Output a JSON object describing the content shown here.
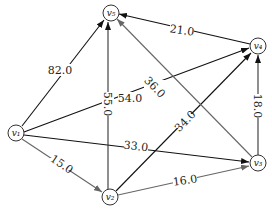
{
  "graph": {
    "type": "directed-weighted",
    "nodes": [
      {
        "id": "v1",
        "label": "v1",
        "x": 16,
        "y": 133
      },
      {
        "id": "v2",
        "label": "v2",
        "x": 110,
        "y": 197
      },
      {
        "id": "v3",
        "label": "v3",
        "x": 258,
        "y": 163
      },
      {
        "id": "v4",
        "label": "v4",
        "x": 258,
        "y": 46
      },
      {
        "id": "v5",
        "label": "v5",
        "x": 111,
        "y": 13
      }
    ],
    "edges": [
      {
        "from": "v1",
        "to": "v5",
        "weight": "82.0",
        "color": "#111111"
      },
      {
        "from": "v1",
        "to": "v4",
        "weight": "54.0",
        "color": "#111111"
      },
      {
        "from": "v1",
        "to": "v3",
        "weight": "33.0",
        "color": "#111111"
      },
      {
        "from": "v1",
        "to": "v2",
        "weight": "15.0",
        "color": "#666666"
      },
      {
        "from": "v2",
        "to": "v5",
        "weight": "55.0",
        "color": "#333333"
      },
      {
        "from": "v2",
        "to": "v4",
        "weight": "34.0",
        "color": "#111111"
      },
      {
        "from": "v2",
        "to": "v3",
        "weight": "16.0",
        "color": "#666666"
      },
      {
        "from": "v3",
        "to": "v4",
        "weight": "18.0",
        "color": "#333333"
      },
      {
        "from": "v3",
        "to": "v5",
        "weight": "36.0",
        "color": "#666666"
      },
      {
        "from": "v4",
        "to": "v5",
        "weight": "21.0",
        "color": "#111111"
      }
    ]
  },
  "labels": {
    "v1": "v₁",
    "v2": "v₂",
    "v3": "v₃",
    "v4": "v₄",
    "v5": "v₅",
    "e_v1_v5": "82.0",
    "e_v1_v4": "54.0",
    "e_v1_v3": "33.0",
    "e_v1_v2": "15.0",
    "e_v2_v5": "55.0",
    "e_v2_v4": "34.0",
    "e_v2_v3": "16.0",
    "e_v3_v4": "18.0",
    "e_v3_v5": "36.0",
    "e_v4_v5": "21.0"
  }
}
